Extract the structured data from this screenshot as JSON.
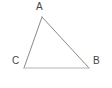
{
  "figure": {
    "kind": "triangle-diagram",
    "background_color": "#ffffff",
    "canvas": {
      "width": 112,
      "height": 88
    },
    "stroke": {
      "side_ca_color": "#8a8a8a",
      "side_ab_color": "#8a8a8a",
      "side_cb_color": "#b4b4b4",
      "width": 1
    },
    "label_color": "#444444",
    "vertices": [
      {
        "name": "A",
        "label": "A",
        "x": 42,
        "y": 17,
        "label_x": 36,
        "label_y": 2
      },
      {
        "name": "C",
        "label": "C",
        "x": 24,
        "y": 68,
        "label_x": 12,
        "label_y": 56
      },
      {
        "name": "B",
        "label": "B",
        "x": 89,
        "y": 68,
        "label_x": 93,
        "label_y": 56
      }
    ],
    "sides": [
      {
        "name": "CA",
        "from": "C",
        "to": "A"
      },
      {
        "name": "AB",
        "from": "A",
        "to": "B"
      },
      {
        "name": "CB",
        "from": "C",
        "to": "B"
      }
    ]
  }
}
